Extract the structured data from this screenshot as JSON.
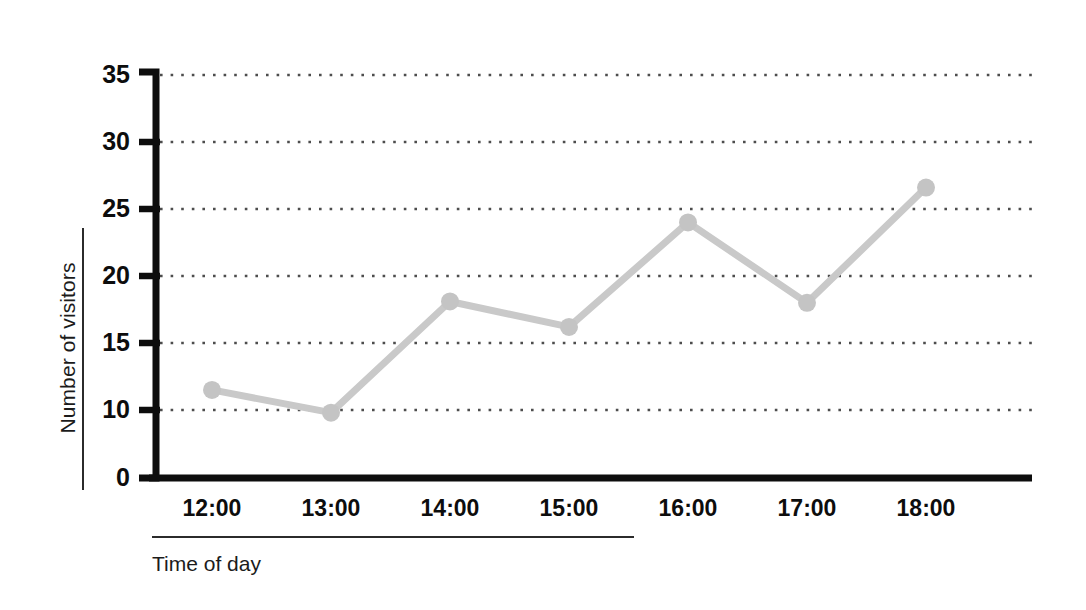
{
  "chart_data": {
    "type": "line",
    "title": "",
    "subtitle": "",
    "xlabel": "Time of day",
    "ylabel": "Number of visitors",
    "categories": [
      "12:00",
      "13:00",
      "14:00",
      "15:00",
      "16:00",
      "17:00",
      "18:00"
    ],
    "values": [
      11.5,
      9.8,
      18.1,
      16.2,
      24.0,
      18.0,
      26.6
    ],
    "series": [
      {
        "name": "Number of visitors",
        "values": [
          11.5,
          9.8,
          18.1,
          16.2,
          24.0,
          18.0,
          26.6
        ]
      }
    ],
    "x_tick_labels": [
      "12:00",
      "13:00",
      "14:00",
      "15:00",
      "16:00",
      "17:00",
      "18:00"
    ],
    "y_tick_labels": [
      "35",
      "30",
      "25",
      "20",
      "15",
      "10",
      "0"
    ],
    "y_tick_values": [
      35,
      30,
      25,
      20,
      15,
      10,
      0
    ],
    "ylim": [
      5,
      35
    ],
    "y_axis_note": "axis broken below 10; 0 drawn one step below 10",
    "grid": "horizontal-dotted",
    "legend": "none",
    "legend_position": "none",
    "annotations": [],
    "colors": {
      "line": "#c9c9c9",
      "marker": "#c4c4c4",
      "axis": "#0d0d0d",
      "grid": "#4d4d4d",
      "text": "#0d0d0d",
      "title_text": "#1b1b1b",
      "background": "#ffffff"
    },
    "style": {
      "line_width": 7,
      "marker_radius": 9,
      "axis_width": 7
    }
  },
  "axes": {
    "y_title": "Number of visitors",
    "x_title": "Time of day"
  }
}
